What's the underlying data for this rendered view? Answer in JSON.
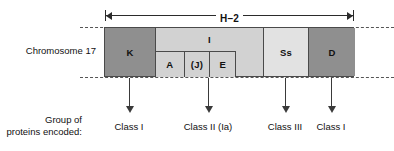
{
  "figure": {
    "chromosome_label": "Chromosome 17",
    "span_label": "H–2",
    "group_caption_line1": "Group of",
    "group_caption_line2": "proteins encoded:"
  },
  "regions": [
    {
      "id": "K",
      "label": "K",
      "shade": "dark",
      "left": 0,
      "width": 51
    },
    {
      "id": "I",
      "label": "I",
      "shade": "mid",
      "left": 51,
      "width": 108
    },
    {
      "id": "Ss",
      "label": "Ss",
      "shade": "light",
      "left": 159,
      "width": 45
    },
    {
      "id": "D",
      "label": "D",
      "shade": "dark",
      "left": 204,
      "width": 46
    }
  ],
  "subregions": [
    {
      "id": "A",
      "label": "A",
      "width": 28
    },
    {
      "id": "J",
      "label": "(J)",
      "width": 26
    },
    {
      "id": "E",
      "label": "E",
      "width": 26
    }
  ],
  "pointers": [
    {
      "x": 129,
      "label": "Class I"
    },
    {
      "x": 208,
      "label": "Class II (Ia)"
    },
    {
      "x": 285,
      "label": "Class III"
    },
    {
      "x": 331,
      "label": "Class I"
    }
  ],
  "colors": {
    "shade_dark": "#8f8f8f",
    "shade_mid": "#d2d2d2",
    "shade_light": "#e2e2e2",
    "outline": "#4a4a4a",
    "guide_dash": "#555555",
    "arrow": "#3a3a3a",
    "text": "#111111",
    "background": "#ffffff"
  }
}
